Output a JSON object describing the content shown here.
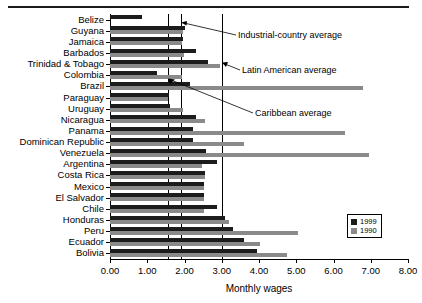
{
  "chart_data": {
    "type": "bar",
    "orientation": "horizontal",
    "title": "",
    "xlabel": "Monthly wages",
    "ylabel": "",
    "xlim": [
      0.0,
      8.0
    ],
    "xticks": [
      "0.00",
      "1.00",
      "2.00",
      "3.00",
      "4.00",
      "5.00",
      "6.00",
      "7.00",
      "8.00"
    ],
    "grid": false,
    "legend_position": "bottom-right",
    "categories": [
      "Belize",
      "Guyana",
      "Jamaica",
      "Barbados",
      "Trinidad & Tobago",
      "Colombia",
      "Brazil",
      "Paraguay",
      "Uruguay",
      "Nicaragua",
      "Panama",
      "Dominican Republic",
      "Venezuela",
      "Argentina",
      "Costa Rica",
      "Mexico",
      "El Salvador",
      "Chile",
      "Honduras",
      "Peru",
      "Ecuador",
      "Bolivia"
    ],
    "series": [
      {
        "name": "1999",
        "color": "#1c1c1c",
        "values": [
          0.85,
          2.0,
          1.96,
          2.3,
          2.63,
          1.26,
          2.15,
          1.58,
          1.6,
          2.3,
          2.22,
          2.23,
          2.58,
          2.88,
          2.55,
          2.52,
          2.52,
          2.88,
          3.1,
          3.3,
          3.6,
          3.95
        ]
      },
      {
        "name": "1990",
        "color": "#8a8a8a",
        "values": [
          0.0,
          1.96,
          1.93,
          1.98,
          2.95,
          1.93,
          6.8,
          1.55,
          1.96,
          2.55,
          6.3,
          3.6,
          6.95,
          2.48,
          2.55,
          2.52,
          2.52,
          2.52,
          3.2,
          5.05,
          4.02,
          4.75
        ]
      }
    ],
    "reference_lines": [
      {
        "label": "Caribbean average",
        "value": 1.55
      },
      {
        "label": "Industrial-country average",
        "value": 1.9
      },
      {
        "label": "Latin American average",
        "value": 3.0
      }
    ],
    "annotations": [
      {
        "key": "industrial",
        "text": "Industrial-country average"
      },
      {
        "key": "latin",
        "text": "Latin American average"
      },
      {
        "key": "caribbean",
        "text": "Caribbean average"
      }
    ]
  }
}
